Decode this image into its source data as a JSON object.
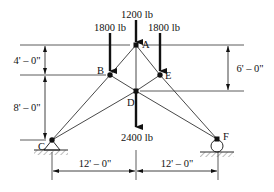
{
  "diagram": {
    "type": "truss",
    "nodes": {
      "A": {
        "label": "A",
        "x": 136,
        "y": 45
      },
      "B": {
        "label": "B",
        "x": 110,
        "y": 75
      },
      "E": {
        "label": "E",
        "x": 160,
        "y": 75
      },
      "D": {
        "label": "D",
        "x": 136,
        "y": 91
      },
      "C": {
        "label": "C",
        "x": 52,
        "y": 140
      },
      "F": {
        "label": "F",
        "x": 217,
        "y": 139
      }
    },
    "members": [
      [
        "A",
        "B"
      ],
      [
        "A",
        "E"
      ],
      [
        "A",
        "D"
      ],
      [
        "B",
        "D"
      ],
      [
        "E",
        "D"
      ],
      [
        "B",
        "C"
      ],
      [
        "D",
        "C"
      ],
      [
        "E",
        "F"
      ],
      [
        "D",
        "F"
      ]
    ],
    "loads": [
      {
        "node": "A",
        "label": "1200 lb",
        "direction": "down"
      },
      {
        "node": "B",
        "label": "1800 lb",
        "direction": "down"
      },
      {
        "node": "E",
        "label": "1800 lb",
        "direction": "down"
      },
      {
        "node": "D",
        "label": "2400 lb",
        "direction": "down"
      }
    ],
    "supports": [
      {
        "node": "C",
        "type": "pin"
      },
      {
        "node": "F",
        "type": "roller"
      }
    ],
    "dimensions": {
      "left_upper": "4' – 0\"",
      "left_lower": "8' – 0\"",
      "right": "6' – 0\"",
      "bottom_left": "12' – 0\"",
      "bottom_right": "12' – 0\""
    }
  }
}
